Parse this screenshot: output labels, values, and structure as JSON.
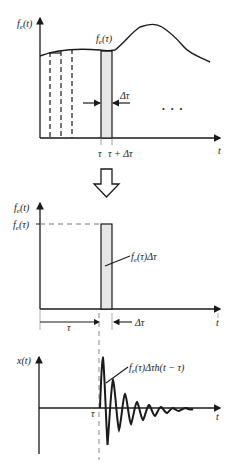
{
  "panel1": {
    "y_axis_label": "f_e(t)",
    "y_axis_label_main": "f",
    "y_axis_label_sub": "e",
    "y_axis_label_arg": "(t)",
    "curve_label_main": "f",
    "curve_label_sub": "e",
    "curve_label_arg": "(τ)",
    "delta_label": "Δτ",
    "tick_tau": "τ",
    "tick_tau_plus": "τ + Δτ",
    "x_axis_label": "t",
    "ellipsis": "• • •"
  },
  "panel2": {
    "y_axis_label_main": "f",
    "y_axis_label_sub": "e",
    "y_axis_label_arg": "(t)",
    "level_label_main": "f",
    "level_label_sub": "e",
    "level_label_arg": "(τ)",
    "pulse_label_main": "f",
    "pulse_label_sub": "e",
    "pulse_label_arg": "(τ)Δτ",
    "tau_span_label": "τ",
    "delta_label": "Δτ",
    "x_axis_label": "t"
  },
  "panel3": {
    "y_axis_label": "x(t)",
    "response_label_main": "f",
    "response_label_sub": "e",
    "response_label_arg": "(τ)Δτh(t − τ)",
    "tick_tau": "τ",
    "x_axis_label": "t"
  },
  "colors": {
    "stroke": "#1a1a1a",
    "pulse_fill": "#e6e6e6",
    "dashed": "#777777"
  }
}
